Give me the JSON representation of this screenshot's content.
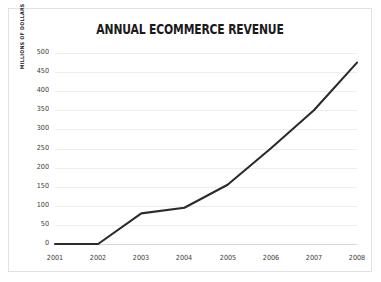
{
  "chart_data": {
    "type": "line",
    "title": "ANNUAL ECOMMERCE REVENUE",
    "xlabel": "",
    "ylabel": "MILLIONS OF DOLLARS",
    "categories": [
      "2001",
      "2002",
      "2003",
      "2004",
      "2005",
      "2006",
      "2007",
      "2008"
    ],
    "x": [
      2001,
      2002,
      2003,
      2004,
      2005,
      2006,
      2007,
      2008
    ],
    "values": [
      0,
      0,
      80,
      95,
      155,
      250,
      350,
      475
    ],
    "series": [
      {
        "name": "Annual ecommerce revenue",
        "values": [
          0,
          0,
          80,
          95,
          155,
          250,
          350,
          475
        ]
      }
    ],
    "ylim": [
      0,
      500
    ],
    "ytick_step": 50,
    "ytick_labels": [
      "0",
      "50",
      "100",
      "150",
      "200",
      "250",
      "300",
      "350",
      "400",
      "450",
      "500"
    ],
    "grid": "horizontal",
    "legend": "none",
    "line_color": "#2b2b2b",
    "grid_color": "#ededed",
    "background_color": "#ffffff",
    "border_color": "#e2e2e2"
  }
}
